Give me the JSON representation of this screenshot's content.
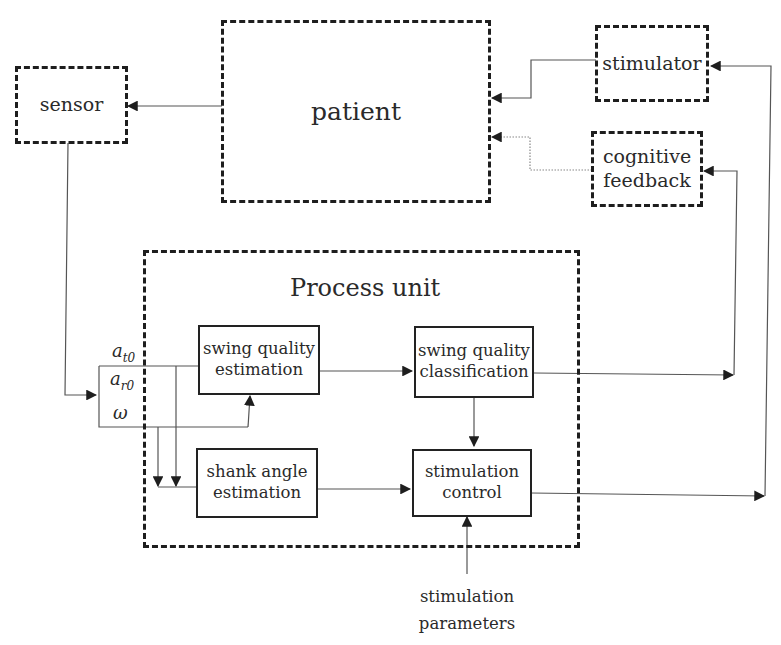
{
  "diagram": {
    "blocks": {
      "patient": "patient",
      "sensor": "sensor",
      "stimulator": "stimulator",
      "cognitive_feedback": [
        "cognitive",
        "feedback"
      ],
      "process_unit": "Process unit",
      "swing_quality_estimation": [
        "swing quality",
        "estimation"
      ],
      "swing_quality_classification": [
        "swing quality",
        "classification"
      ],
      "shank_angle_estimation": [
        "shank angle",
        "estimation"
      ],
      "stimulation_control": [
        "stimulation",
        "control"
      ],
      "stimulation_parameters": [
        "stimulation",
        "parameters"
      ]
    },
    "signals": {
      "a_t0": {
        "base": "a",
        "sub": "t0"
      },
      "a_r0": {
        "base": "a",
        "sub": "r0"
      },
      "omega": "ω"
    },
    "connections": [
      {
        "from": "patient",
        "to": "sensor",
        "style": "solid"
      },
      {
        "from": "stimulator",
        "to": "patient",
        "style": "solid"
      },
      {
        "from": "cognitive feedback",
        "to": "patient",
        "style": "dotted"
      },
      {
        "from": "sensor",
        "to": "signal bus (a_t0, a_r0, ω)",
        "style": "solid"
      },
      {
        "from": "signal bus",
        "to": "swing quality estimation",
        "style": "solid"
      },
      {
        "from": "signal bus",
        "to": "shank angle estimation",
        "style": "solid"
      },
      {
        "from": "swing quality estimation",
        "to": "swing quality classification",
        "style": "solid"
      },
      {
        "from": "swing quality classification",
        "to": "stimulation control",
        "style": "solid"
      },
      {
        "from": "swing quality classification",
        "to": "cognitive feedback",
        "style": "solid"
      },
      {
        "from": "shank angle estimation",
        "to": "stimulation control",
        "style": "solid"
      },
      {
        "from": "stimulation parameters",
        "to": "stimulation control",
        "style": "solid"
      },
      {
        "from": "stimulation control",
        "to": "stimulator",
        "style": "solid"
      }
    ]
  }
}
